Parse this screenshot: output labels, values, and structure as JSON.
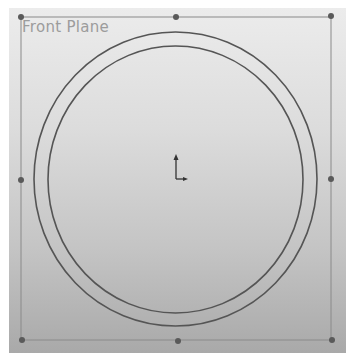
{
  "viewport": {
    "plane_label": "Front Plane",
    "colors": {
      "background_top": "#ececec",
      "background_bottom": "#a9a9a9",
      "plane_border": "#8a8a8a",
      "sketch_line": "#555555",
      "handle": "#5a5a5a",
      "label": "#9c9c9c"
    }
  },
  "plane_border": {
    "x1": 21,
    "y1": 17,
    "x2": 331,
    "y2": 340
  },
  "handles": [
    {
      "name": "top-left",
      "x": 21,
      "y": 17
    },
    {
      "name": "top-middle",
      "x": 176,
      "y": 17
    },
    {
      "name": "top-right",
      "x": 331,
      "y": 16
    },
    {
      "name": "middle-left",
      "x": 21,
      "y": 180
    },
    {
      "name": "middle-right",
      "x": 331,
      "y": 179
    },
    {
      "name": "bottom-left",
      "x": 22,
      "y": 340
    },
    {
      "name": "bottom-middle",
      "x": 178,
      "y": 341
    },
    {
      "name": "bottom-right",
      "x": 332,
      "y": 340
    }
  ],
  "sketch": {
    "outer_circle": {
      "cx": 175.5,
      "cy": 179,
      "rx": 141.5,
      "ry": 147
    },
    "inner_circle": {
      "cx": 175.5,
      "cy": 179.5,
      "rx": 127.5,
      "ry": 133.5
    }
  },
  "origin": {
    "x": 176,
    "y": 179
  }
}
